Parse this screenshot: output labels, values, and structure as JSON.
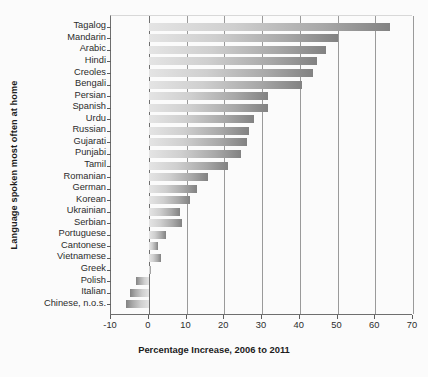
{
  "chart_data": {
    "type": "bar",
    "orientation": "horizontal",
    "title": "",
    "xlabel": "Percentage Increase, 2006 to 2011",
    "ylabel": "Language spoken most often at home",
    "xlim": [
      -10,
      70
    ],
    "xticks": [
      -10,
      0,
      10,
      20,
      30,
      40,
      50,
      60,
      70
    ],
    "xticklabels": [
      "-10",
      "0",
      "10",
      "20",
      "30",
      "40",
      "50",
      "60",
      "70"
    ],
    "grid": true,
    "legend": null,
    "categories": [
      "Tagalog",
      "Mandarin",
      "Arabic",
      "Hindi",
      "Creoles",
      "Bengali",
      "Persian",
      "Spanish",
      "Urdu",
      "Russian",
      "Gujarati",
      "Punjabi",
      "Tamil",
      "Romanian",
      "German",
      "Korean",
      "Ukrainian",
      "Serbian",
      "Portuguese",
      "Cantonese",
      "Vietnamese",
      "Greek",
      "Polish",
      "Italian",
      "Chinese, n.o.s."
    ],
    "values": [
      64.0,
      50.0,
      47.0,
      44.5,
      43.5,
      40.5,
      31.5,
      31.5,
      28.0,
      26.5,
      26.0,
      24.5,
      21.0,
      15.6,
      12.7,
      10.8,
      8.3,
      8.7,
      4.7,
      2.5,
      3.2,
      0.7,
      -3.5,
      -4.9,
      -6.0
    ],
    "bar_color_start": "#e4e4e4",
    "bar_color_end": "#828282"
  }
}
